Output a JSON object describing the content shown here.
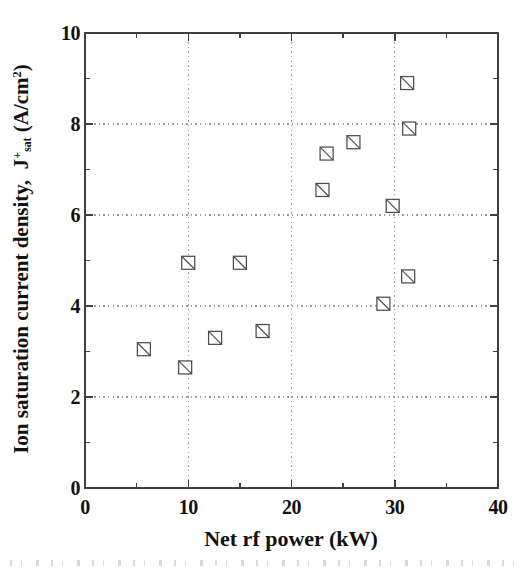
{
  "figure": {
    "background_color": "#ffffff",
    "axis_color": "#3f3f3f",
    "grid_color": "#9b9b9b",
    "marker_color": "#4d4d4d",
    "marker_fill": "#ffffff",
    "text_color": "#111111"
  },
  "chart_data": {
    "type": "scatter",
    "title": "",
    "xlabel": "Net rf power (kW)",
    "ylabel": "Ion saturation current density, J+sat (A/cm2)",
    "ylabel_parts": {
      "prefix": "Ion saturation current density,  J",
      "sup": "+",
      "sub": "sat",
      "unit_open": " (A/cm",
      "unit_sup": "2",
      "unit_close": ")"
    },
    "xlim": [
      0,
      40
    ],
    "ylim": [
      0,
      10
    ],
    "x_major_ticks": [
      0,
      10,
      20,
      30,
      40
    ],
    "x_minor_ticks": [
      5,
      15,
      25,
      35
    ],
    "y_major_ticks": [
      0,
      2,
      4,
      6,
      8,
      10
    ],
    "y_minor_ticks": [
      1,
      3,
      5,
      7,
      9
    ],
    "grid_x": [
      10,
      20,
      30
    ],
    "grid_y": [
      2,
      4,
      6,
      8
    ],
    "grid_style": "dotted",
    "legend": "none",
    "marker_style": "open-square-with-diagonal",
    "points": [
      {
        "x": 5.7,
        "y": 3.05
      },
      {
        "x": 9.7,
        "y": 2.65
      },
      {
        "x": 10.0,
        "y": 4.95
      },
      {
        "x": 12.6,
        "y": 3.3
      },
      {
        "x": 15.0,
        "y": 4.95
      },
      {
        "x": 17.2,
        "y": 3.45
      },
      {
        "x": 23.0,
        "y": 6.55
      },
      {
        "x": 23.4,
        "y": 7.35
      },
      {
        "x": 26.0,
        "y": 7.6
      },
      {
        "x": 28.9,
        "y": 4.05
      },
      {
        "x": 29.8,
        "y": 6.2
      },
      {
        "x": 31.2,
        "y": 8.9
      },
      {
        "x": 31.4,
        "y": 7.9
      },
      {
        "x": 31.3,
        "y": 4.65
      }
    ]
  }
}
